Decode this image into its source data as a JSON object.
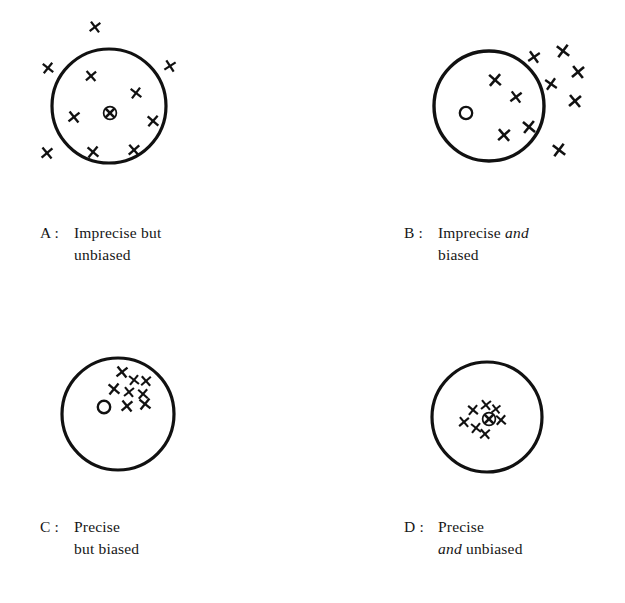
{
  "figure": {
    "background_color": "#ffffff",
    "ink_color": "#111111",
    "width": 625,
    "height": 603
  },
  "panels": [
    {
      "id": "A",
      "key": "A :",
      "caption_lines": [
        {
          "parts": [
            {
              "text": "Imprecise but",
              "italic": false
            }
          ]
        },
        {
          "parts": [
            {
              "text": "unbiased",
              "italic": false
            }
          ]
        }
      ],
      "caption_plain": "A : Imprecise but unbiased",
      "caption_x": 40,
      "caption_y": 222,
      "circle": {
        "cx": 109,
        "cy": 106,
        "r": 57,
        "stroke_width": 3.2
      },
      "target": {
        "type": "circle-with-x",
        "cx": 110,
        "cy": 113,
        "r": 6.4,
        "stroke_width": 1.7
      },
      "marks": [
        {
          "x": 95,
          "y": 27,
          "size": 9.5,
          "rot": 8
        },
        {
          "x": 48,
          "y": 68,
          "size": 9.5,
          "rot": -6
        },
        {
          "x": 170,
          "y": 66,
          "size": 9.5,
          "rot": 12
        },
        {
          "x": 91,
          "y": 76,
          "size": 9.5,
          "rot": 4
        },
        {
          "x": 136,
          "y": 93,
          "size": 9.5,
          "rot": -8
        },
        {
          "x": 74,
          "y": 117,
          "size": 10,
          "rot": 6
        },
        {
          "x": 153,
          "y": 121,
          "size": 10,
          "rot": -4
        },
        {
          "x": 47,
          "y": 153,
          "size": 10,
          "rot": 5
        },
        {
          "x": 93,
          "y": 152,
          "size": 10,
          "rot": -5
        },
        {
          "x": 134,
          "y": 150,
          "size": 10,
          "rot": 3
        }
      ]
    },
    {
      "id": "B",
      "key": "B :",
      "caption_lines": [
        {
          "parts": [
            {
              "text": "Imprecise ",
              "italic": false
            },
            {
              "text": "and",
              "italic": true
            }
          ]
        },
        {
          "parts": [
            {
              "text": "biased",
              "italic": false
            }
          ]
        }
      ],
      "caption_plain": "B : Imprecise and biased",
      "caption_x": 404,
      "caption_y": 222,
      "circle": {
        "cx": 489,
        "cy": 106,
        "r": 55,
        "stroke_width": 3.4
      },
      "target": {
        "type": "open-circle",
        "cx": 466,
        "cy": 113,
        "r": 6.2,
        "stroke_width": 2.3
      },
      "marks": [
        {
          "x": 534,
          "y": 57,
          "size": 10,
          "rot": 10
        },
        {
          "x": 563,
          "y": 51,
          "size": 11,
          "rot": -8
        },
        {
          "x": 578,
          "y": 72,
          "size": 11,
          "rot": 6
        },
        {
          "x": 551,
          "y": 84,
          "size": 10,
          "rot": -10
        },
        {
          "x": 575,
          "y": 101,
          "size": 11,
          "rot": 5
        },
        {
          "x": 495,
          "y": 80,
          "size": 11,
          "rot": -4
        },
        {
          "x": 516,
          "y": 97,
          "size": 10,
          "rot": 8
        },
        {
          "x": 529,
          "y": 127,
          "size": 11,
          "rot": -6
        },
        {
          "x": 504,
          "y": 135,
          "size": 11,
          "rot": 4
        },
        {
          "x": 559,
          "y": 150,
          "size": 11,
          "rot": -8
        }
      ]
    },
    {
      "id": "C",
      "key": "C :",
      "caption_lines": [
        {
          "parts": [
            {
              "text": "Precise",
              "italic": false
            }
          ]
        },
        {
          "parts": [
            {
              "text": "but biased",
              "italic": false
            }
          ]
        }
      ],
      "caption_plain": "C : Precise but biased",
      "caption_x": 40,
      "caption_y": 516,
      "circle": {
        "cx": 118,
        "cy": 414,
        "r": 56,
        "stroke_width": 3.2
      },
      "target": {
        "type": "open-circle",
        "cx": 104,
        "cy": 407,
        "r": 6.2,
        "stroke_width": 2.4
      },
      "marks": [
        {
          "x": 122,
          "y": 372,
          "size": 10,
          "rot": 6
        },
        {
          "x": 134,
          "y": 380,
          "size": 9,
          "rot": -6
        },
        {
          "x": 146,
          "y": 381,
          "size": 9,
          "rot": 4
        },
        {
          "x": 114,
          "y": 389,
          "size": 10,
          "rot": -5
        },
        {
          "x": 129,
          "y": 392,
          "size": 9,
          "rot": 6
        },
        {
          "x": 143,
          "y": 394,
          "size": 9,
          "rot": -4
        },
        {
          "x": 127,
          "y": 406,
          "size": 10,
          "rot": 5
        },
        {
          "x": 145,
          "y": 404,
          "size": 10,
          "rot": -6
        }
      ]
    },
    {
      "id": "D",
      "key": "D :",
      "caption_lines": [
        {
          "parts": [
            {
              "text": "Precise",
              "italic": false
            }
          ]
        },
        {
          "parts": [
            {
              "text": "and",
              "italic": true
            },
            {
              "text": " unbiased",
              "italic": false
            }
          ]
        }
      ],
      "caption_plain": "D : Precise and unbiased",
      "caption_x": 404,
      "caption_y": 516,
      "circle": {
        "cx": 487,
        "cy": 417,
        "r": 55,
        "stroke_width": 3.2
      },
      "target": {
        "type": "circle-with-x",
        "cx": 489,
        "cy": 419,
        "r": 6.4,
        "stroke_width": 1.7
      },
      "marks": [
        {
          "x": 486,
          "y": 405,
          "size": 9,
          "rot": 6
        },
        {
          "x": 473,
          "y": 410,
          "size": 9,
          "rot": -5
        },
        {
          "x": 464,
          "y": 422,
          "size": 9,
          "rot": 5
        },
        {
          "x": 476,
          "y": 428,
          "size": 9,
          "rot": -6
        },
        {
          "x": 485,
          "y": 434,
          "size": 9,
          "rot": 4
        },
        {
          "x": 501,
          "y": 420,
          "size": 9,
          "rot": -4
        },
        {
          "x": 496,
          "y": 409,
          "size": 8,
          "rot": 7
        }
      ]
    }
  ]
}
